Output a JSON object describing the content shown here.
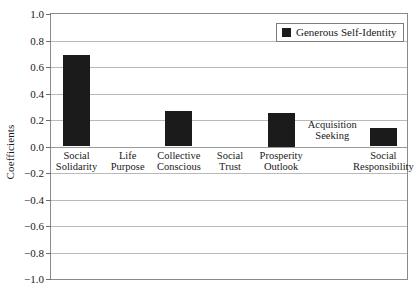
{
  "chart_data": {
    "type": "bar",
    "title": "",
    "xlabel": "",
    "ylabel": "Coefficients",
    "ylim": [
      -1.0,
      1.0
    ],
    "yticks": [
      "1.0",
      "0.8",
      "0.6",
      "0.4",
      "0.2",
      "0.0",
      "−0.2",
      "−0.4",
      "−0.6",
      "−0.8",
      "−1.0"
    ],
    "ytick_values": [
      1.0,
      0.8,
      0.6,
      0.4,
      0.2,
      0.0,
      -0.2,
      -0.4,
      -0.6,
      -0.8,
      -1.0
    ],
    "grid": true,
    "legend_position": "top-right",
    "categories": [
      "Social Solidarity",
      "Life Purpose",
      "Collective Conscious",
      "Social Trust",
      "Prosperity Outlook",
      "Acquisition Seeking",
      "Social Responsibility"
    ],
    "category_lines": [
      [
        "Social",
        "Solidarity"
      ],
      [
        "Life",
        "Purpose"
      ],
      [
        "Collective",
        "Conscious"
      ],
      [
        "Social",
        "Trust"
      ],
      [
        "Prosperity",
        "Outlook"
      ],
      [
        "Acquisition",
        "Seeking"
      ],
      [
        "Social",
        "Responsibility"
      ]
    ],
    "series": [
      {
        "name": "Generous Self-Identity",
        "color": "#1b1b1b",
        "values": [
          0.69,
          0.0,
          0.27,
          0.0,
          0.25,
          0.0,
          0.14
        ]
      }
    ]
  },
  "legend": {
    "entries": [
      {
        "label": "Generous Self-Identity",
        "color": "#1b1b1b"
      }
    ]
  },
  "axis": {
    "y_title": "Coefficients"
  }
}
